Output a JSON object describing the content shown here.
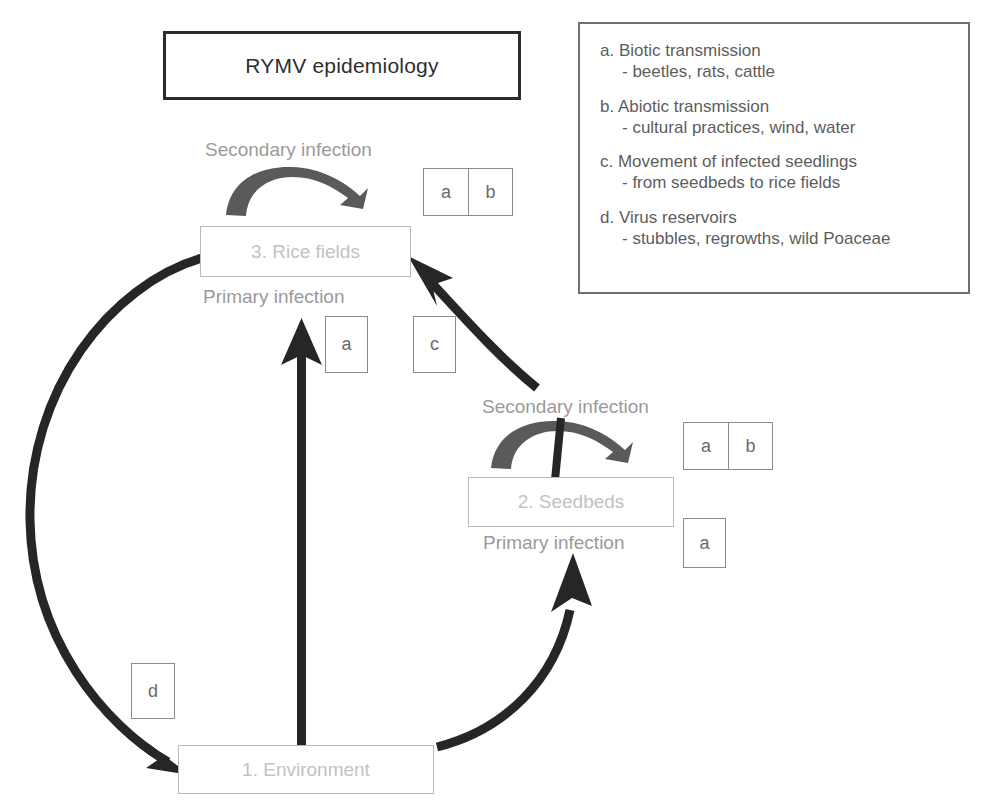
{
  "title": {
    "text": "RYMV epidemiology"
  },
  "legend": {
    "entries": [
      {
        "head": "a. Biotic transmission",
        "sub": "- beetles, rats, cattle"
      },
      {
        "head": "b. Abiotic transmission",
        "sub": "- cultural practices, wind, water"
      },
      {
        "head": "c. Movement of infected seedlings",
        "sub": "- from seedbeds to rice fields"
      },
      {
        "head": "d. Virus reservoirs",
        "sub": "- stubbles, regrowths, wild Poaceae"
      }
    ]
  },
  "nodes": {
    "rice_fields": "3. Rice fields",
    "seedbeds": "2. Seedbeds",
    "environment": "1. Environment"
  },
  "labels": {
    "secondary_infection_rice": "Secondary infection",
    "primary_infection_rice": "Primary infection",
    "secondary_infection_seedbeds": "Secondary infection",
    "primary_infection_seedbeds": "Primary infection"
  },
  "codes": {
    "rice_secondary_pair": [
      "a",
      "b"
    ],
    "rice_primary_a": "a",
    "rice_incoming_c": "c",
    "seedbeds_secondary_pair": [
      "a",
      "b"
    ],
    "seedbeds_primary_a": "a",
    "environment_d": "d"
  },
  "colors": {
    "title_border": "#2b2b2b",
    "legend_border": "#6f6f6f",
    "node_border": "#b9b9b9",
    "node_text": "#c2c2c2",
    "label_text": "#9a9a9a",
    "code_border": "#8a8a8a",
    "code_text": "#6b6b6b",
    "arrow_black": "#262626",
    "arrow_gray": "#5a5a5a",
    "background": "#ffffff"
  },
  "icons": {
    "loop_arrow": "secondary-infection-loop-arrow",
    "straight_arrow": "primary-infection-arrow",
    "curved_arrow": "cycle-arc-arrow"
  }
}
